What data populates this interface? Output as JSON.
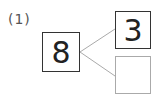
{
  "problem": {
    "label": "(1)",
    "whole": "8",
    "part_top": "3",
    "part_bottom": ""
  },
  "colors": {
    "line": "#aaaaaa",
    "box_border": "#333333",
    "empty_box_border": "#aaaaaa"
  }
}
